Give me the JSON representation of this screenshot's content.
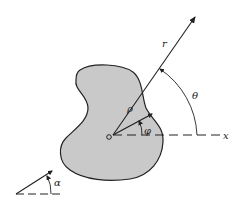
{
  "diagram": {
    "labels": {
      "r": "r",
      "theta": "θ",
      "rho": "ρ",
      "phi": "φ",
      "x": "x",
      "origin": "O",
      "alpha": "α"
    },
    "colors": {
      "region_fill": "#c9c9c9",
      "stroke": "#222222",
      "background": "#ffffff"
    }
  }
}
